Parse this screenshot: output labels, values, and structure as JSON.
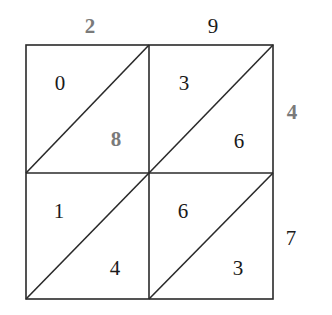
{
  "diagram": {
    "type": "lattice-multiplication",
    "colors": {
      "line": "#2a2a2a",
      "digit": "#1a1a1a",
      "highlight": "#7a7a7a"
    },
    "top_digits": [
      "2",
      "9"
    ],
    "right_digits": [
      "4",
      "7"
    ],
    "cells": [
      {
        "upper": "0",
        "lower": "8"
      },
      {
        "upper": "3",
        "lower": "6"
      },
      {
        "upper": "1",
        "lower": "4"
      },
      {
        "upper": "6",
        "lower": "3"
      }
    ]
  }
}
